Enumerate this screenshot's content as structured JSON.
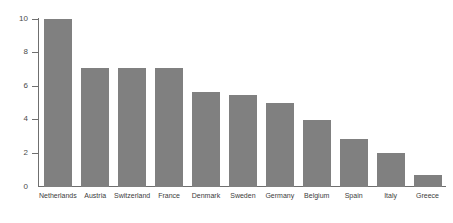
{
  "chart_data": {
    "type": "bar",
    "title": "",
    "subtitle": "",
    "xlabel": "",
    "ylabel": "",
    "ylim": [
      0,
      10
    ],
    "yticks": [
      0,
      2,
      4,
      6,
      8,
      10
    ],
    "grid": false,
    "legend": null,
    "bar_color": "#808080",
    "axis_color": "#6f6f6f",
    "categories": [
      "Netherlands",
      "Austria",
      "Switzerland",
      "France",
      "Denmark",
      "Sweden",
      "Germany",
      "Belgium",
      "Spain",
      "Italy",
      "Greece"
    ],
    "values": [
      10.0,
      7.1,
      7.1,
      7.1,
      5.65,
      5.45,
      5.0,
      4.0,
      2.85,
      2.0,
      0.7
    ]
  }
}
